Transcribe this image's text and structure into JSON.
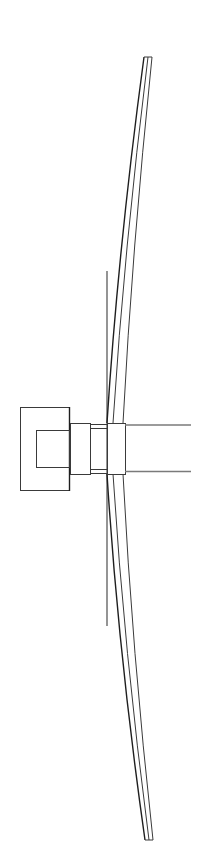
{
  "diagram": {
    "type": "technical line drawing",
    "colors": {
      "background": "#ffffff",
      "stroke": "#3a3a3a",
      "stroke_dark": "#1e1e1e",
      "rod": "#7a7a7a"
    },
    "components": [
      {
        "name": "housing-outer",
        "shape": "rectangle"
      },
      {
        "name": "housing-inner",
        "shape": "rectangle"
      },
      {
        "name": "coupling",
        "shape": "rectangle"
      },
      {
        "name": "shaft",
        "shape": "rectangle"
      },
      {
        "name": "hub",
        "shape": "rectangle"
      },
      {
        "name": "upper-blade",
        "shape": "curved strip"
      },
      {
        "name": "lower-blade",
        "shape": "curved strip"
      },
      {
        "name": "vertical-rod",
        "shape": "line"
      },
      {
        "name": "upper-arm",
        "shape": "line"
      },
      {
        "name": "lower-arm",
        "shape": "line"
      }
    ]
  }
}
